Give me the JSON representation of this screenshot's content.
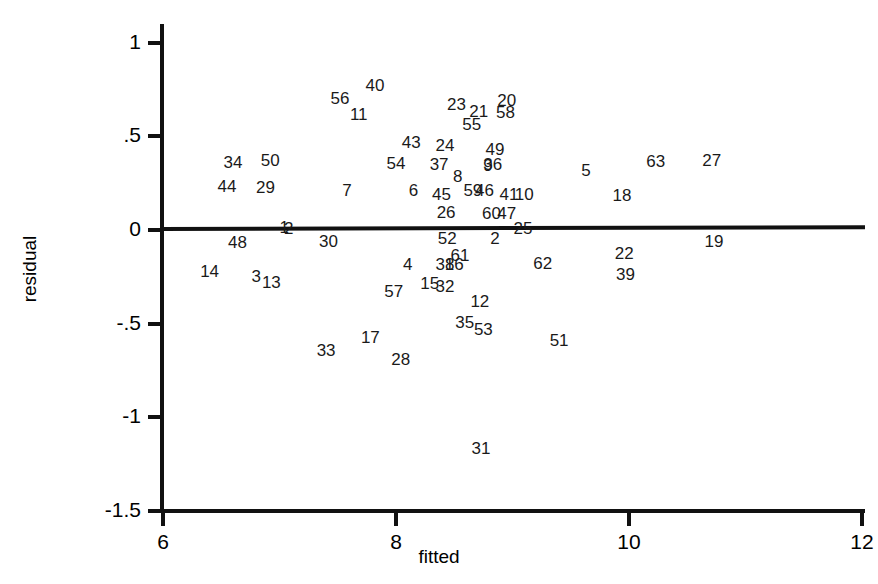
{
  "chart_data": {
    "type": "scatter",
    "title": "",
    "xlabel": "fitted",
    "ylabel": "residual",
    "xlim": [
      6,
      12
    ],
    "ylim": [
      -1.5,
      1.1
    ],
    "grid": false,
    "legend": null,
    "xticks": [
      "6",
      "8",
      "10",
      "12"
    ],
    "xtick_values": [
      6,
      8,
      10,
      12
    ],
    "yticks": [
      "1",
      ".5",
      "0",
      "-.5",
      "-1",
      "-1.5"
    ],
    "ytick_values": [
      1,
      0.5,
      0,
      -0.5,
      -1,
      -1.5
    ],
    "reference_line": {
      "name": "zero-residual-line",
      "y_at_xmin": 0.005,
      "y_at_xmax": 0.015
    },
    "point_label_field": "observation id",
    "points": [
      {
        "label": "40",
        "x": 7.82,
        "y": 0.775
      },
      {
        "label": "56",
        "x": 7.52,
        "y": 0.705
      },
      {
        "label": "23",
        "x": 8.52,
        "y": 0.675
      },
      {
        "label": "20",
        "x": 8.95,
        "y": 0.695
      },
      {
        "label": "21",
        "x": 8.71,
        "y": 0.635
      },
      {
        "label": "58",
        "x": 8.94,
        "y": 0.63
      },
      {
        "label": "11",
        "x": 7.68,
        "y": 0.62
      },
      {
        "label": "55",
        "x": 8.65,
        "y": 0.565
      },
      {
        "label": "43",
        "x": 8.13,
        "y": 0.47
      },
      {
        "label": "24",
        "x": 8.42,
        "y": 0.455
      },
      {
        "label": "49",
        "x": 8.85,
        "y": 0.43
      },
      {
        "label": "34",
        "x": 6.6,
        "y": 0.365
      },
      {
        "label": "50",
        "x": 6.92,
        "y": 0.375
      },
      {
        "label": "54",
        "x": 8.0,
        "y": 0.36
      },
      {
        "label": "37",
        "x": 8.37,
        "y": 0.35
      },
      {
        "label": "36",
        "x": 8.83,
        "y": 0.355
      },
      {
        "label": "9",
        "x": 8.79,
        "y": 0.345
      },
      {
        "label": "63",
        "x": 10.23,
        "y": 0.37
      },
      {
        "label": "27",
        "x": 10.71,
        "y": 0.375
      },
      {
        "label": "5",
        "x": 9.63,
        "y": 0.32
      },
      {
        "label": "8",
        "x": 8.53,
        "y": 0.29
      },
      {
        "label": "44",
        "x": 6.55,
        "y": 0.235
      },
      {
        "label": "29",
        "x": 6.88,
        "y": 0.23
      },
      {
        "label": "7",
        "x": 7.58,
        "y": 0.215
      },
      {
        "label": "6",
        "x": 8.15,
        "y": 0.215
      },
      {
        "label": "45",
        "x": 8.39,
        "y": 0.195
      },
      {
        "label": "59",
        "x": 8.66,
        "y": 0.215
      },
      {
        "label": "46",
        "x": 8.76,
        "y": 0.215
      },
      {
        "label": "41",
        "x": 8.97,
        "y": 0.195
      },
      {
        "label": "10",
        "x": 9.1,
        "y": 0.195
      },
      {
        "label": "18",
        "x": 9.94,
        "y": 0.185
      },
      {
        "label": "26",
        "x": 8.43,
        "y": 0.095
      },
      {
        "label": "60",
        "x": 8.82,
        "y": 0.09
      },
      {
        "label": "47",
        "x": 8.95,
        "y": 0.09
      },
      {
        "label": "1",
        "x": 7.04,
        "y": 0.015
      },
      {
        "label": "2",
        "x": 7.08,
        "y": 0.01
      },
      {
        "label": "25",
        "x": 9.09,
        "y": 0.01
      },
      {
        "label": "52",
        "x": 8.44,
        "y": -0.045
      },
      {
        "label": "2",
        "x": 8.85,
        "y": -0.045
      },
      {
        "label": "48",
        "x": 6.64,
        "y": -0.065
      },
      {
        "label": "30",
        "x": 7.42,
        "y": -0.06
      },
      {
        "label": "19",
        "x": 10.73,
        "y": -0.06
      },
      {
        "label": "22",
        "x": 9.96,
        "y": -0.125
      },
      {
        "label": "61",
        "x": 8.55,
        "y": -0.135
      },
      {
        "label": "4",
        "x": 8.1,
        "y": -0.18
      },
      {
        "label": "38",
        "x": 8.42,
        "y": -0.18
      },
      {
        "label": "16",
        "x": 8.5,
        "y": -0.18
      },
      {
        "label": "62",
        "x": 9.26,
        "y": -0.175
      },
      {
        "label": "14",
        "x": 6.4,
        "y": -0.22
      },
      {
        "label": "39",
        "x": 9.97,
        "y": -0.235
      },
      {
        "label": "3",
        "x": 6.8,
        "y": -0.245
      },
      {
        "label": "13",
        "x": 6.93,
        "y": -0.275
      },
      {
        "label": "15",
        "x": 8.29,
        "y": -0.285
      },
      {
        "label": "32",
        "x": 8.42,
        "y": -0.3
      },
      {
        "label": "57",
        "x": 7.98,
        "y": -0.325
      },
      {
        "label": "12",
        "x": 8.72,
        "y": -0.38
      },
      {
        "label": "35",
        "x": 8.59,
        "y": -0.49
      },
      {
        "label": "53",
        "x": 8.75,
        "y": -0.53
      },
      {
        "label": "17",
        "x": 7.78,
        "y": -0.57
      },
      {
        "label": "51",
        "x": 9.4,
        "y": -0.585
      },
      {
        "label": "33",
        "x": 7.4,
        "y": -0.64
      },
      {
        "label": "28",
        "x": 8.04,
        "y": -0.69
      },
      {
        "label": "31",
        "x": 8.73,
        "y": -1.165
      }
    ]
  }
}
